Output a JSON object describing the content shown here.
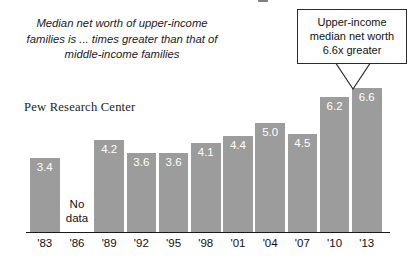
{
  "figure": {
    "subtitle": "Median net worth of upper-income families is ... times greater than that of middle-income families",
    "source": "Pew Research Center",
    "no_data_label_line1": "No",
    "no_data_label_line2": "data",
    "bar_color": "#9c9c9c",
    "axis_color": "#1a1a1a",
    "callout_border_color": "#2b2b2b"
  },
  "callout": {
    "line1": "Upper-income",
    "line2": "median net worth",
    "line3": "6.6x greater",
    "target_category": "'13"
  },
  "chart_data": {
    "type": "bar",
    "title": "Median net worth of upper-income families is ... times greater than that of middle-income families",
    "subtitle": "",
    "xlabel": "",
    "ylabel": "",
    "ylim": [
      0,
      6.6
    ],
    "grid": false,
    "legend": false,
    "categories": [
      "'83",
      "'86",
      "'89",
      "'92",
      "'95",
      "'98",
      "'01",
      "'04",
      "'07",
      "'10",
      "'13"
    ],
    "values": [
      3.4,
      null,
      4.2,
      3.6,
      3.6,
      4.1,
      4.4,
      5.0,
      4.5,
      6.2,
      6.6
    ],
    "value_labels": [
      "3.4",
      "",
      "4.2",
      "3.6",
      "3.6",
      "4.1",
      "4.4",
      "5.0",
      "4.5",
      "6.2",
      "6.6"
    ],
    "missing_categories": [
      "'86"
    ],
    "missing_note": "No data",
    "annotations": [
      {
        "text": "Upper-income median net worth 6.6x greater",
        "attached_to": "'13"
      }
    ]
  }
}
